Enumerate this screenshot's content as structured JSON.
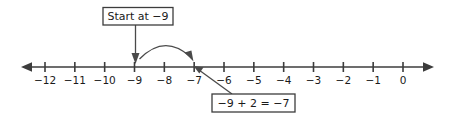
{
  "chart_data": {
    "type": "line",
    "title": "",
    "xlabel": "",
    "ylabel": "",
    "axis_min": -12,
    "axis_max": 0,
    "tick_labels": [
      "−12",
      "−11",
      "−10",
      "−9",
      "−8",
      "−7",
      "−6",
      "−5",
      "−4",
      "−3",
      "−2",
      "−1",
      "0"
    ],
    "tick_values": [
      -12,
      -11,
      -10,
      -9,
      -8,
      -7,
      -6,
      -5,
      -4,
      -3,
      -2,
      -1,
      0
    ],
    "grid": false,
    "legend": "none",
    "annotations": [
      {
        "label": "Start at −9",
        "points_to": -9
      },
      {
        "label": "−9 + 2 = −7",
        "points_to": -7
      }
    ],
    "jump": {
      "from": -9,
      "to": -7,
      "amount": 2
    }
  },
  "diagram": {
    "start_callout": {
      "label": "Start at −9"
    },
    "result_callout": {
      "label": "−9 + 2 = −7"
    },
    "axis": {
      "ticks": [
        {
          "label": "−12",
          "value": -12
        },
        {
          "label": "−11",
          "value": -11
        },
        {
          "label": "−10",
          "value": -10
        },
        {
          "label": "−9",
          "value": -9
        },
        {
          "label": "−8",
          "value": -8
        },
        {
          "label": "−7",
          "value": -7
        },
        {
          "label": "−6",
          "value": -6
        },
        {
          "label": "−5",
          "value": -5
        },
        {
          "label": "−4",
          "value": -4
        },
        {
          "label": "−3",
          "value": -3
        },
        {
          "label": "−2",
          "value": -2
        },
        {
          "label": "−1",
          "value": -1
        },
        {
          "label": "0",
          "value": 0
        }
      ]
    },
    "colors": {
      "stroke": "#3c3c3c",
      "annotation_stroke": "#4a4a4a",
      "text": "#1a1a1a",
      "background": "#ffffff"
    }
  }
}
